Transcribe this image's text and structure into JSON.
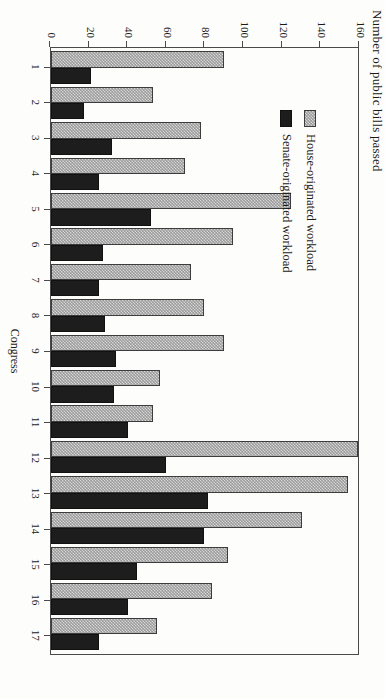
{
  "chart_data": {
    "type": "bar",
    "orientation": "horizontal-rotated-page",
    "title": "",
    "xlabel": "Congress",
    "ylabel": "Number of public bills passed",
    "categories": [
      "1",
      "2",
      "3",
      "4",
      "5",
      "6",
      "7",
      "8",
      "9",
      "10",
      "11",
      "12",
      "13",
      "14",
      "15",
      "16",
      "17"
    ],
    "ylim": [
      0,
      160
    ],
    "yticks": [
      160,
      140,
      120,
      100,
      80,
      60,
      40,
      20,
      0
    ],
    "grid": false,
    "legend_position": "upper-left-inside",
    "series": [
      {
        "name": "House-originated workload",
        "fill": "checkered-gray",
        "color": "#9a9a9a",
        "values": [
          90,
          53,
          78,
          70,
          125,
          95,
          73,
          80,
          90,
          57,
          53,
          160,
          155,
          131,
          92,
          84,
          55
        ]
      },
      {
        "name": "Senate-originated workload",
        "fill": "solid-black",
        "color": "#1d1d1d",
        "values": [
          21,
          17,
          32,
          25,
          52,
          27,
          25,
          28,
          34,
          33,
          40,
          60,
          82,
          80,
          45,
          40,
          25
        ]
      }
    ]
  },
  "axis": {
    "value_title": "Number of public bills passed",
    "category_title": "Congress"
  }
}
